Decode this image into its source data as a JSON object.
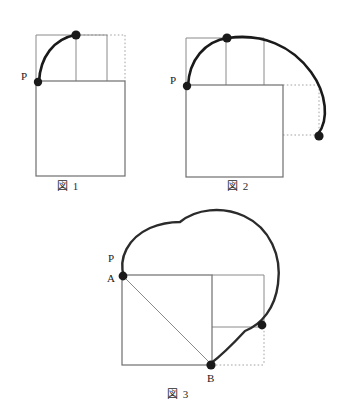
{
  "page": {
    "background_color": "#ffffff",
    "ink_color": "#1a1a1a",
    "thin_line_color": "#808080",
    "dotted_line_color": "#9a9a9a",
    "width": 354,
    "height": 418
  },
  "figures": [
    {
      "id": "fig1",
      "caption": "図 1",
      "description": "正方形の左上の頂点Pが四分円の弧を描いて上の頂点へ移動する図",
      "point_labels": [
        {
          "name": "P",
          "text": "P"
        }
      ],
      "markers": 2,
      "has_dotted_guides": true,
      "square": {
        "x": 36,
        "y": 81,
        "width": 89,
        "height": 95
      },
      "upper_box": {
        "x": 36,
        "y": 35,
        "width": 71,
        "height": 46
      }
    },
    {
      "id": "fig2",
      "caption": "図 2",
      "description": "正方形が回転し点Pが大きな弧を描いて右下へ移動する図",
      "point_labels": [
        {
          "name": "P",
          "text": "P"
        }
      ],
      "markers": 3,
      "has_dotted_guides": true,
      "square": {
        "x": 186,
        "y": 85,
        "width": 97,
        "height": 92
      },
      "upper_box": {
        "x": 186,
        "y": 38,
        "width": 78,
        "height": 47
      }
    },
    {
      "id": "fig3",
      "caption": "図 3",
      "description": "正方形ABの対角線と点Pの描く軌跡（弧の連なり）を示す図",
      "point_labels": [
        {
          "name": "P",
          "text": "P"
        },
        {
          "name": "A",
          "text": "A"
        },
        {
          "name": "B",
          "text": "B"
        }
      ],
      "markers": 3,
      "has_dotted_guides": true,
      "square": {
        "x": 122,
        "y": 275,
        "width": 90,
        "height": 90
      },
      "right_box": {
        "x": 212,
        "y": 275,
        "width": 52,
        "height": 52
      },
      "diagonal": {
        "from": "A",
        "to": "B"
      }
    }
  ]
}
